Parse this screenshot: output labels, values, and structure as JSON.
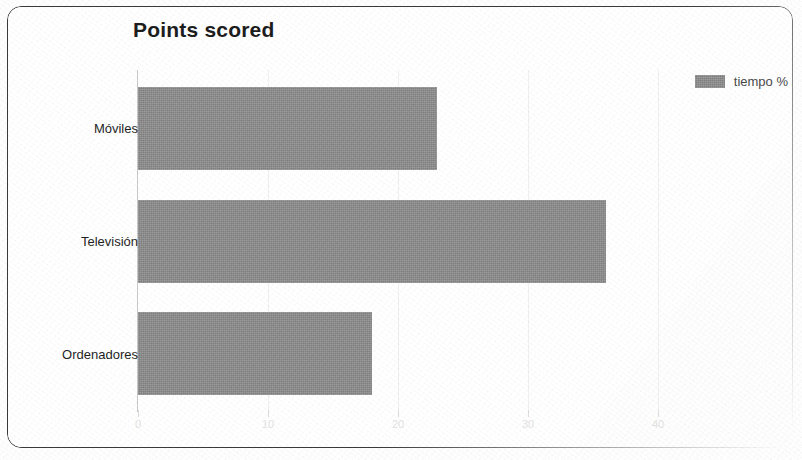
{
  "chart_data": {
    "type": "bar",
    "orientation": "horizontal",
    "title": "Points scored",
    "categories": [
      "Móviles",
      "Televisión",
      "Ordenadores"
    ],
    "values": [
      23,
      36,
      18
    ],
    "series": [
      {
        "name": "tiempo %",
        "values": [
          23,
          36,
          18
        ]
      }
    ],
    "xlabel": "",
    "ylabel": "",
    "xlim": [
      0,
      42
    ],
    "xticks": [
      0,
      10,
      20,
      30,
      40
    ],
    "xtick_labels": [
      "0",
      "10",
      "20",
      "30",
      "40"
    ],
    "grid": true,
    "legend": {
      "position": "top-right",
      "entries": [
        {
          "label": "tiempo %",
          "color": "#8d8d8d"
        }
      ]
    },
    "colors": {
      "bar": "#8d8d8d",
      "title": "#1d1d1d",
      "axis": "#c9c9c9",
      "tick_label": "#e2e2e2",
      "category_label": "#1f1f1f",
      "card_border": "#3a3a3a",
      "background": "#ffffff"
    }
  }
}
